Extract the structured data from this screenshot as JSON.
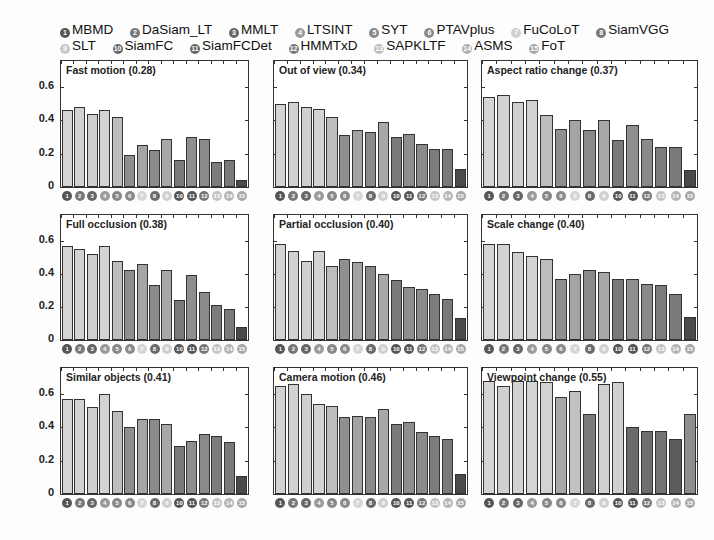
{
  "legend": {
    "rows": [
      [
        {
          "num": "1",
          "label": "MBMD",
          "color": "#555555"
        },
        {
          "num": "2",
          "label": "DaSiam_LT",
          "color": "#777777"
        },
        {
          "num": "3",
          "label": "MMLT",
          "color": "#666666"
        },
        {
          "num": "4",
          "label": "LTSINT",
          "color": "#9a9a9a"
        },
        {
          "num": "5",
          "label": "SYT",
          "color": "#888888"
        },
        {
          "num": "6",
          "label": "PTAVplus",
          "color": "#8a8a8a"
        },
        {
          "num": "7",
          "label": "FuCoLoT",
          "color": "#d0d0d0"
        },
        {
          "num": "8",
          "label": "SiamVGG",
          "color": "#777777"
        }
      ],
      [
        {
          "num": "9",
          "label": "SLT",
          "color": "#c8c8c8"
        },
        {
          "num": "10",
          "label": "SiamFC",
          "color": "#666666"
        },
        {
          "num": "11",
          "label": "SiamFCDet",
          "color": "#666666"
        },
        {
          "num": "12",
          "label": "HMMTxD",
          "color": "#7a7a7a"
        },
        {
          "num": "13",
          "label": "SAPKLTF",
          "color": "#bdbdbd"
        },
        {
          "num": "14",
          "label": "ASMS",
          "color": "#b0b0b0"
        },
        {
          "num": "15",
          "label": "FoT",
          "color": "#a8a8a8"
        }
      ]
    ]
  },
  "badge_colors": [
    "#555555",
    "#777777",
    "#666666",
    "#9a9a9a",
    "#888888",
    "#8a8a8a",
    "#d6d6d6",
    "#6a6a6a",
    "#cfcfcf",
    "#555555",
    "#555555",
    "#777777",
    "#c4c4c4",
    "#b5b5b5",
    "#a8a8a8"
  ],
  "y_ticks": [
    "0",
    "0.2",
    "0.4",
    "0.6"
  ],
  "chart_data": [
    {
      "type": "bar",
      "title": "Fast motion (0.28)",
      "categories": [
        "1",
        "2",
        "3",
        "4",
        "5",
        "6",
        "7",
        "8",
        "9",
        "10",
        "11",
        "12",
        "13",
        "14",
        "15"
      ],
      "values": [
        0.46,
        0.48,
        0.44,
        0.46,
        0.42,
        0.19,
        0.25,
        0.22,
        0.29,
        0.16,
        0.3,
        0.29,
        0.15,
        0.16,
        0.04
      ],
      "ylim": [
        0,
        0.75
      ],
      "ylabel": "",
      "xlabel": ""
    },
    {
      "type": "bar",
      "title": "Out of view (0.34)",
      "categories": [
        "1",
        "2",
        "3",
        "4",
        "5",
        "6",
        "7",
        "8",
        "9",
        "10",
        "11",
        "12",
        "13",
        "14",
        "15"
      ],
      "values": [
        0.5,
        0.51,
        0.48,
        0.47,
        0.42,
        0.31,
        0.34,
        0.33,
        0.39,
        0.3,
        0.32,
        0.26,
        0.23,
        0.23,
        0.11
      ],
      "ylim": [
        0,
        0.75
      ]
    },
    {
      "type": "bar",
      "title": "Aspect ratio change (0.37)",
      "categories": [
        "1",
        "2",
        "3",
        "4",
        "5",
        "6",
        "7",
        "8",
        "9",
        "10",
        "11",
        "12",
        "13",
        "14",
        "15"
      ],
      "values": [
        0.54,
        0.55,
        0.51,
        0.52,
        0.43,
        0.35,
        0.4,
        0.34,
        0.4,
        0.28,
        0.37,
        0.29,
        0.24,
        0.24,
        0.1
      ],
      "ylim": [
        0,
        0.75
      ]
    },
    {
      "type": "bar",
      "title": "Full occlusion (0.38)",
      "categories": [
        "1",
        "2",
        "3",
        "4",
        "5",
        "6",
        "7",
        "8",
        "9",
        "10",
        "11",
        "12",
        "13",
        "14",
        "15"
      ],
      "values": [
        0.57,
        0.55,
        0.52,
        0.57,
        0.48,
        0.42,
        0.46,
        0.33,
        0.42,
        0.24,
        0.39,
        0.29,
        0.21,
        0.19,
        0.08
      ],
      "ylim": [
        0,
        0.75
      ]
    },
    {
      "type": "bar",
      "title": "Partial occlusion (0.40)",
      "categories": [
        "1",
        "2",
        "3",
        "4",
        "5",
        "6",
        "7",
        "8",
        "9",
        "10",
        "11",
        "12",
        "13",
        "14",
        "15"
      ],
      "values": [
        0.58,
        0.54,
        0.48,
        0.54,
        0.45,
        0.49,
        0.47,
        0.45,
        0.4,
        0.36,
        0.32,
        0.31,
        0.28,
        0.25,
        0.13
      ],
      "ylim": [
        0,
        0.75
      ]
    },
    {
      "type": "bar",
      "title": "Scale change (0.40)",
      "categories": [
        "1",
        "2",
        "3",
        "4",
        "5",
        "6",
        "7",
        "8",
        "9",
        "10",
        "11",
        "12",
        "13",
        "14",
        "15"
      ],
      "values": [
        0.58,
        0.58,
        0.53,
        0.51,
        0.49,
        0.37,
        0.4,
        0.42,
        0.41,
        0.37,
        0.37,
        0.34,
        0.33,
        0.28,
        0.14
      ],
      "ylim": [
        0,
        0.75
      ]
    },
    {
      "type": "bar",
      "title": "Similar objects (0.41)",
      "categories": [
        "1",
        "2",
        "3",
        "4",
        "5",
        "6",
        "7",
        "8",
        "9",
        "10",
        "11",
        "12",
        "13",
        "14",
        "15"
      ],
      "values": [
        0.57,
        0.57,
        0.52,
        0.6,
        0.5,
        0.4,
        0.45,
        0.45,
        0.42,
        0.29,
        0.32,
        0.36,
        0.35,
        0.31,
        0.11
      ],
      "ylim": [
        0,
        0.75
      ]
    },
    {
      "type": "bar",
      "title": "Camera motion (0.46)",
      "categories": [
        "1",
        "2",
        "3",
        "4",
        "5",
        "6",
        "7",
        "8",
        "9",
        "10",
        "11",
        "12",
        "13",
        "14",
        "15"
      ],
      "values": [
        0.65,
        0.66,
        0.6,
        0.54,
        0.53,
        0.46,
        0.47,
        0.46,
        0.51,
        0.42,
        0.43,
        0.37,
        0.35,
        0.33,
        0.12
      ],
      "ylim": [
        0,
        0.75
      ]
    },
    {
      "type": "bar",
      "title": "Viewpoint change (0.55)",
      "categories": [
        "1",
        "2",
        "3",
        "4",
        "5",
        "6",
        "7",
        "8",
        "9",
        "10",
        "11",
        "12",
        "13",
        "14",
        "15"
      ],
      "values": [
        0.68,
        0.65,
        0.68,
        0.68,
        0.67,
        0.58,
        0.62,
        0.48,
        0.66,
        0.67,
        0.4,
        0.38,
        0.38,
        0.33,
        0.48
      ],
      "ylim": [
        0,
        0.75
      ]
    }
  ]
}
